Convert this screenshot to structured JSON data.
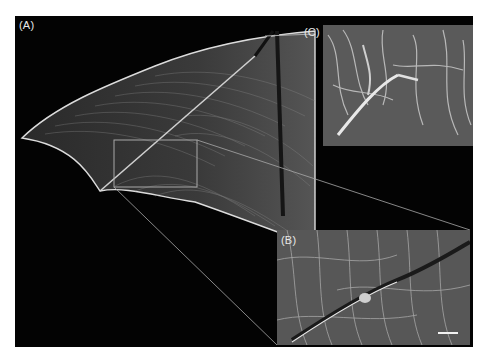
{
  "figure": {
    "panels": [
      {
        "id": "A",
        "label": "(A)",
        "description": "Whole bat wing membrane, dark background, with rectangular inset marker"
      },
      {
        "id": "B",
        "label": "(B)",
        "description": "Magnified view of boxed region showing fibre network crossing a bone"
      },
      {
        "id": "C",
        "label": "(C)",
        "description": "Scanning electron micrograph of fibrous membrane surface"
      }
    ],
    "scale_bar": {
      "visible": true,
      "panel": "B",
      "label": ""
    },
    "colors": {
      "background": "#030303",
      "page": "#ffffff",
      "label": "#e8e8e8",
      "lines": "#bdbdbd"
    }
  }
}
